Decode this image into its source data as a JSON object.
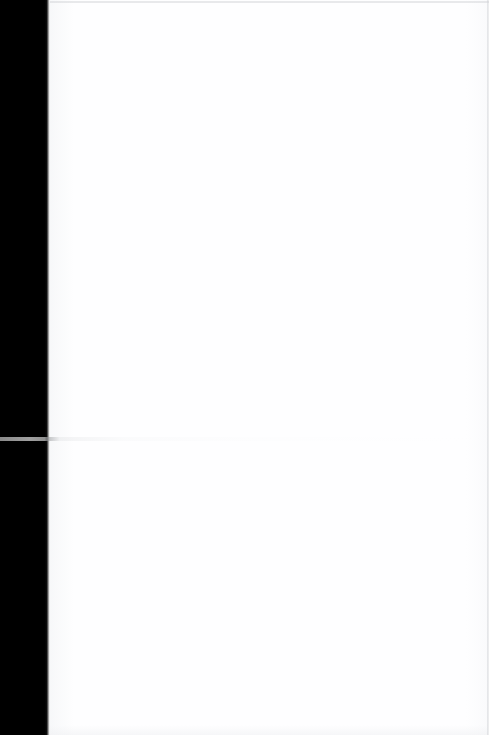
{
  "document": {
    "kind": "scanned-page",
    "page_state": "blank",
    "width": 496,
    "height": 735,
    "caption": ""
  },
  "regions": {
    "gutter": {
      "name": "scanner-gutter",
      "color": "#000000",
      "left": 0,
      "width": 48
    },
    "page": {
      "name": "page-surface",
      "color": "#fefeff",
      "left": 48,
      "width": 440
    },
    "right_margin": {
      "name": "right-margin",
      "color": "#ffffff",
      "left": 489,
      "width": 7
    }
  },
  "artifacts": {
    "top_rule": {
      "name": "top-edge-rule",
      "color": "#c7c9cd",
      "y": 1
    },
    "right_rule": {
      "name": "right-edge-rule",
      "color": "#ced0d4",
      "x": 487
    },
    "scan_line": {
      "name": "scan-line",
      "color": "#a8a8a8",
      "y": 437
    },
    "bottom_shade": {
      "name": "bottom-edge-shade",
      "color": "#f0f1f3"
    }
  }
}
